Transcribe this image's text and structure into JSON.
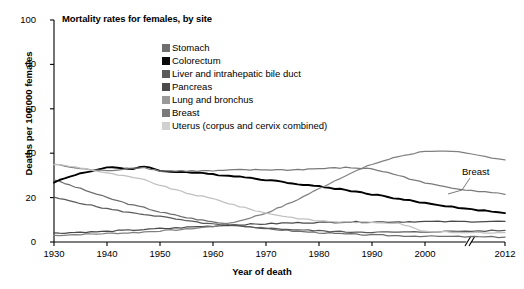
{
  "chart_data": {
    "type": "line",
    "title": "Mortality rates for females, by site",
    "xlabel": "Year of death",
    "ylabel": "Deaths per 100,000 females",
    "xlim": [
      1930,
      2012
    ],
    "ylim": [
      0,
      100
    ],
    "yticks": [
      0,
      20,
      40,
      60,
      80,
      100
    ],
    "xticks": [
      1930,
      1940,
      1950,
      1960,
      1970,
      1980,
      1990,
      2000,
      2012
    ],
    "xtick_labels": [
      "1930",
      "1940",
      "1950",
      "1960",
      "1970",
      "1980",
      "1990",
      "2000",
      "2012"
    ],
    "ytick_labels": [
      "0",
      "20",
      "40",
      "60",
      "80",
      "100"
    ],
    "grid": false,
    "axis_break": {
      "at_year": 2005,
      "axis": "x",
      "note": "axis break between 2000 and 2012"
    },
    "legend_position": "top-center-inside",
    "annotations": [
      {
        "text": "Breast",
        "x": 2004,
        "y": 30,
        "points_to_series": "Breast"
      }
    ],
    "x": [
      1930,
      1935,
      1940,
      1945,
      1947,
      1950,
      1955,
      1960,
      1965,
      1970,
      1975,
      1980,
      1985,
      1990,
      1995,
      2000,
      2005,
      2012
    ],
    "series": [
      {
        "name": "Stomach",
        "color": "#6e6e6e",
        "values": [
          28.0,
          24.0,
          20.0,
          16.5,
          15.5,
          13.5,
          11.0,
          9.0,
          7.5,
          6.0,
          5.0,
          4.2,
          3.6,
          3.2,
          2.8,
          2.6,
          2.4,
          2.2
        ]
      },
      {
        "name": "Colorectum",
        "color": "#000000",
        "values": [
          27.0,
          31.0,
          33.5,
          33.0,
          34.2,
          32.0,
          31.5,
          30.5,
          29.5,
          28.0,
          26.5,
          25.0,
          23.5,
          21.5,
          19.5,
          17.5,
          15.5,
          13.0
        ]
      },
      {
        "name": "Liver and intrahepatic bile duct",
        "color": "#5a5a5a",
        "values": [
          20.0,
          17.5,
          15.0,
          13.0,
          12.5,
          11.5,
          9.5,
          8.0,
          7.0,
          6.2,
          5.6,
          5.0,
          4.6,
          4.4,
          4.4,
          4.6,
          4.8,
          5.2
        ]
      },
      {
        "name": "Pancreas",
        "color": "#4a4a4a",
        "values": [
          4.0,
          4.4,
          4.8,
          5.4,
          5.6,
          6.0,
          6.6,
          7.2,
          7.8,
          8.2,
          8.6,
          8.8,
          9.0,
          9.0,
          9.1,
          9.2,
          9.2,
          9.3
        ]
      },
      {
        "name": "Lung and bronchus",
        "color": "#808080",
        "values": [
          3.0,
          3.4,
          3.8,
          4.2,
          4.5,
          5.0,
          5.8,
          7.0,
          9.5,
          13.0,
          18.0,
          24.0,
          30.0,
          35.0,
          38.5,
          41.0,
          40.5,
          37.0
        ]
      },
      {
        "name": "Breast",
        "color": "#7a7a7a",
        "values": [
          35.0,
          33.0,
          32.0,
          33.5,
          33.5,
          32.0,
          32.0,
          32.0,
          32.5,
          32.5,
          32.5,
          33.0,
          33.5,
          33.0,
          30.0,
          26.5,
          24.0,
          21.5
        ]
      },
      {
        "name": "Uterus (corpus and cervix combined)",
        "color": "#c0c0c0",
        "values": [
          35.0,
          33.5,
          31.0,
          29.0,
          28.0,
          25.5,
          22.0,
          19.5,
          16.0,
          13.0,
          11.0,
          9.5,
          9.0,
          8.8,
          8.6,
          4.6,
          4.4,
          4.2
        ]
      }
    ]
  },
  "legend": {
    "items": [
      {
        "label": "Stomach",
        "swatch": "#6e6e6e"
      },
      {
        "label": "Colorectum",
        "swatch": "#0a0a0a"
      },
      {
        "label": "Liver and intrahepatic bile duct",
        "swatch": "#5a5a5a"
      },
      {
        "label": "Pancreas",
        "swatch": "#4a4a4a"
      },
      {
        "label": "Lung and bronchus",
        "swatch": "#999999"
      },
      {
        "label": "Breast",
        "swatch": "#7a7a7a"
      },
      {
        "label": "Uterus (corpus and cervix combined)",
        "swatch": "#d0d0d0"
      }
    ]
  }
}
